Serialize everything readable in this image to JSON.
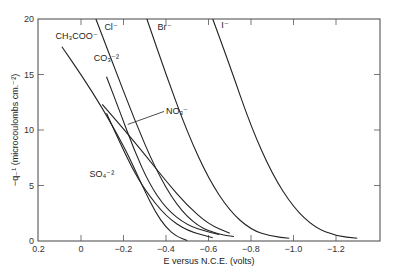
{
  "chart_data": {
    "type": "line",
    "title": "",
    "xlabel": "E versus N.C.E. (volts)",
    "ylabel": "−q₋¹ (microcoulombs cm.⁻²)",
    "xlim": [
      0.2,
      -1.41
    ],
    "ylim": [
      0,
      20
    ],
    "x_ticks": [
      0.2,
      0,
      -0.2,
      -0.4,
      -0.6,
      -0.8,
      -1.0,
      -1.2
    ],
    "x_tick_labels": [
      "0.2",
      "0",
      "−0.2",
      "−0.4",
      "−0.6",
      "−0.8",
      "−1.0",
      "−1.2"
    ],
    "y_ticks": [
      0,
      5,
      10,
      15,
      20
    ],
    "y_tick_labels": [
      "0",
      "5",
      "10",
      "15",
      "20"
    ],
    "grid": false,
    "legend": "inline curve labels",
    "series": [
      {
        "name": "CH₃COO⁻",
        "label_pos": [
          0.12,
          18.2
        ],
        "points": [
          [
            0.09,
            17.5
          ],
          [
            0.0,
            15.0
          ],
          [
            -0.1,
            12.0
          ],
          [
            -0.2,
            8.6
          ],
          [
            -0.25,
            6.6
          ],
          [
            -0.3,
            4.5
          ],
          [
            -0.35,
            2.6
          ],
          [
            -0.4,
            1.2
          ],
          [
            -0.45,
            0.4
          ],
          [
            -0.5,
            0.05
          ]
        ]
      },
      {
        "name": "Cl⁻",
        "label_pos": [
          -0.11,
          19.0
        ],
        "points": [
          [
            -0.07,
            20.0
          ],
          [
            -0.15,
            16.0
          ],
          [
            -0.25,
            11.0
          ],
          [
            -0.35,
            6.5
          ],
          [
            -0.45,
            3.2
          ],
          [
            -0.55,
            1.3
          ],
          [
            -0.65,
            0.6
          ],
          [
            -0.72,
            0.4
          ]
        ]
      },
      {
        "name": "Br⁻",
        "label_pos": [
          -0.36,
          19.0
        ],
        "points": [
          [
            -0.31,
            20.0
          ],
          [
            -0.4,
            15.0
          ],
          [
            -0.5,
            9.8
          ],
          [
            -0.6,
            5.6
          ],
          [
            -0.7,
            2.7
          ],
          [
            -0.8,
            1.0
          ],
          [
            -0.9,
            0.4
          ],
          [
            -0.98,
            0.25
          ]
        ]
      },
      {
        "name": "I⁻",
        "label_pos": [
          -0.66,
          19.2
        ],
        "points": [
          [
            -0.62,
            20.0
          ],
          [
            -0.7,
            15.8
          ],
          [
            -0.8,
            10.3
          ],
          [
            -0.9,
            6.0
          ],
          [
            -1.0,
            3.0
          ],
          [
            -1.1,
            1.2
          ],
          [
            -1.2,
            0.45
          ],
          [
            -1.3,
            0.25
          ]
        ]
      },
      {
        "name": "CO₃⁻²",
        "label_pos": [
          -0.06,
          16.2
        ],
        "points": [
          [
            -0.12,
            14.8
          ],
          [
            -0.18,
            11.8
          ],
          [
            -0.25,
            8.2
          ],
          [
            -0.32,
            5.2
          ],
          [
            -0.4,
            2.9
          ],
          [
            -0.5,
            1.4
          ],
          [
            -0.6,
            0.8
          ],
          [
            -0.65,
            0.6
          ]
        ]
      },
      {
        "name": "NO₃⁻",
        "label_pos": [
          -0.4,
          11.4
        ],
        "arrow_to": [
          -0.22,
          10.5
        ],
        "points": [
          [
            -0.1,
            12.3
          ],
          [
            -0.2,
            10.1
          ],
          [
            -0.3,
            7.8
          ],
          [
            -0.4,
            5.4
          ],
          [
            -0.5,
            3.2
          ],
          [
            -0.6,
            1.5
          ],
          [
            -0.7,
            0.7
          ]
        ]
      },
      {
        "name": "SO₄⁻²",
        "label_pos": [
          -0.04,
          5.8
        ],
        "points": [
          [
            -0.12,
            11.5
          ],
          [
            -0.18,
            9.0
          ],
          [
            -0.24,
            6.6
          ],
          [
            -0.3,
            4.6
          ],
          [
            -0.4,
            2.2
          ],
          [
            -0.5,
            0.9
          ],
          [
            -0.62,
            0.3
          ]
        ]
      }
    ]
  },
  "caption_fragment": ""
}
